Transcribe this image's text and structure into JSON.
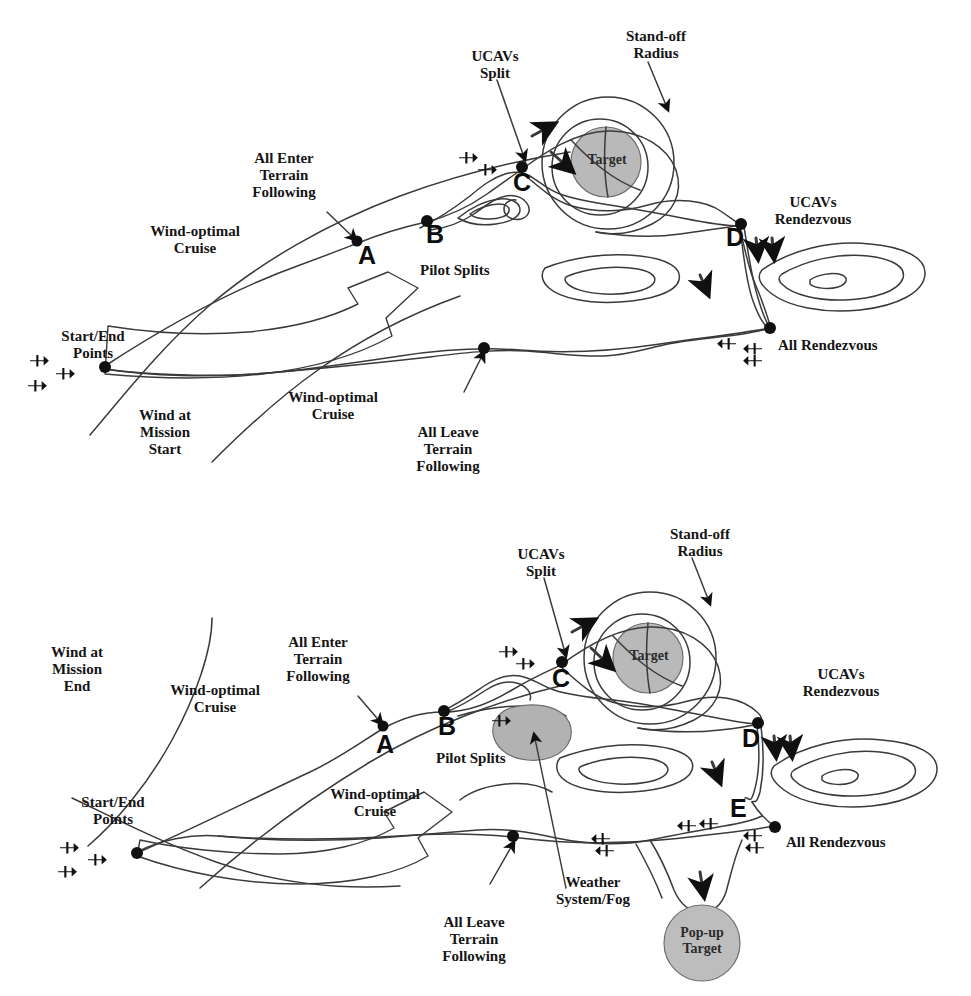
{
  "figure": {
    "colors": {
      "stroke": "#3a3a3a",
      "ink": "#151515",
      "target_fill": "#b9b9b9",
      "weather_fill": "#b2b2b2",
      "popup_fill": "#bdbdbd",
      "background": "#ffffff"
    }
  },
  "top_diagram": {
    "name": "Mission start scenario",
    "labels": {
      "ucavs_split": "UCAVs\nSplit",
      "standoff_radius": "Stand-off\nRadius",
      "all_enter_terrain_following": "All Enter\nTerrain\nFollowing",
      "wind_optimal_cruise_upper": "Wind-optimal\nCruise",
      "wind_optimal_cruise_lower": "Wind-optimal\nCruise",
      "start_end_points": "Start/End\nPoints",
      "wind_at_mission_start": "Wind at\nMission\nStart",
      "all_leave_terrain_following": "All Leave\nTerrain\nFollowing",
      "pilot_splits": "Pilot Splits",
      "ucavs_rendezvous": "UCAVs\nRendezvous",
      "all_rendezvous": "All Rendezvous",
      "target": "Target"
    },
    "waypoints": [
      {
        "id": "A",
        "x": 358,
        "y": 243
      },
      {
        "id": "B",
        "x": 426,
        "y": 222
      },
      {
        "id": "C",
        "x": 521,
        "y": 170
      },
      {
        "id": "D",
        "x": 740,
        "y": 225
      }
    ]
  },
  "bottom_diagram": {
    "name": "Mission end scenario with weather and pop-up target",
    "labels": {
      "ucavs_split": "UCAVs\nSplit",
      "standoff_radius": "Stand-off\nRadius",
      "all_enter_terrain_following": "All Enter\nTerrain\nFollowing",
      "wind_at_mission_end": "Wind at\nMission\nEnd",
      "wind_optimal_cruise_upper": "Wind-optimal\nCruise",
      "wind_optimal_cruise_lower": "Wind-optimal\nCruise",
      "start_end_points": "Start/End\nPoints",
      "all_leave_terrain_following": "All Leave\nTerrain\nFollowing",
      "pilot_splits": "Pilot Splits",
      "weather_system_fog": "Weather\nSystem/Fog",
      "ucavs_rendezvous": "UCAVs\nRendezvous",
      "all_rendezvous": "All Rendezvous",
      "target": "Target",
      "popup_target": "Pop-up\nTarget"
    },
    "waypoints": [
      {
        "id": "A",
        "x": 384,
        "y": 228
      },
      {
        "id": "B",
        "x": 443,
        "y": 212
      },
      {
        "id": "C",
        "x": 561,
        "y": 165
      },
      {
        "id": "D",
        "x": 757,
        "y": 225
      },
      {
        "id": "E",
        "x": 745,
        "y": 297
      }
    ]
  }
}
